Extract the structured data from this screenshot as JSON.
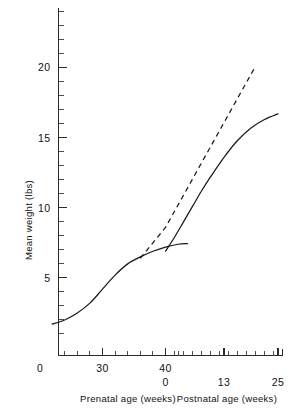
{
  "chart_data": {
    "type": "line",
    "title": "",
    "ylabel": "Mean weight (lbs)",
    "ylim": [
      0,
      24.5
    ],
    "y_major_ticks": [
      5,
      10,
      15,
      20
    ],
    "y_major_tick_labels": [
      "5",
      "10",
      "15",
      "20"
    ],
    "y_minor_tick_interval": 1,
    "grid": false,
    "legend": "none",
    "x_axes": [
      {
        "name": "prenatal",
        "label": "Prenatal age (weeks)",
        "tick_labels": [
          "0",
          "30",
          "40"
        ],
        "tick_values": [
          0,
          30,
          40
        ],
        "range": [
          22,
          44
        ]
      },
      {
        "name": "postnatal",
        "label": "Postnatal age (weeks)",
        "tick_labels": [
          "0",
          "13",
          "25"
        ],
        "tick_values": [
          0,
          13,
          25
        ],
        "range": [
          0,
          25
        ]
      }
    ],
    "series": [
      {
        "name": "prenatal-growth-curve",
        "style": "solid",
        "points": [
          [
            22,
            1.7
          ],
          [
            24,
            2.0
          ],
          [
            26,
            2.5
          ],
          [
            28,
            3.2
          ],
          [
            30,
            4.2
          ],
          [
            32,
            5.2
          ],
          [
            34,
            6.0
          ],
          [
            36,
            6.5
          ],
          [
            38,
            6.9
          ],
          [
            40,
            7.2
          ],
          [
            42,
            7.4
          ],
          [
            43.5,
            7.45
          ]
        ]
      },
      {
        "name": "postnatal-growth-curve",
        "style": "solid",
        "points": [
          [
            0,
            6.9
          ],
          [
            2,
            7.9
          ],
          [
            4,
            9.0
          ],
          [
            6,
            10.1
          ],
          [
            8,
            11.2
          ],
          [
            10,
            12.2
          ],
          [
            13,
            13.6
          ],
          [
            16,
            14.8
          ],
          [
            19,
            15.7
          ],
          [
            22,
            16.3
          ],
          [
            25,
            16.7
          ]
        ]
      },
      {
        "name": "extrapolated-intrauterine-curve",
        "style": "dashed",
        "points": [
          [
            36,
            6.4
          ],
          [
            40,
            8.6
          ],
          [
            44,
            10.9
          ],
          [
            48,
            13.2
          ],
          [
            52,
            15.5
          ],
          [
            56,
            17.8
          ],
          [
            60,
            20.1
          ]
        ]
      }
    ],
    "annotations": [
      {
        "name": "birth-weight-drop",
        "description": "Discontinuity at birth: solid curve drops from 7.45 lbs to 6.9 lbs"
      }
    ]
  },
  "axes": {
    "y_title": "Mean weight (lbs)",
    "y_labels": [
      "20",
      "15",
      "10",
      "5"
    ],
    "x_row1": [
      "0",
      "30",
      "40"
    ],
    "x_row2": [
      "0",
      "13",
      "25"
    ],
    "x_title_left": "Prenatal age (weeks)",
    "x_title_right": "Postnatal age (weeks)"
  },
  "colors": {
    "ink": "#1a1a1a",
    "background": "#ffffff"
  }
}
